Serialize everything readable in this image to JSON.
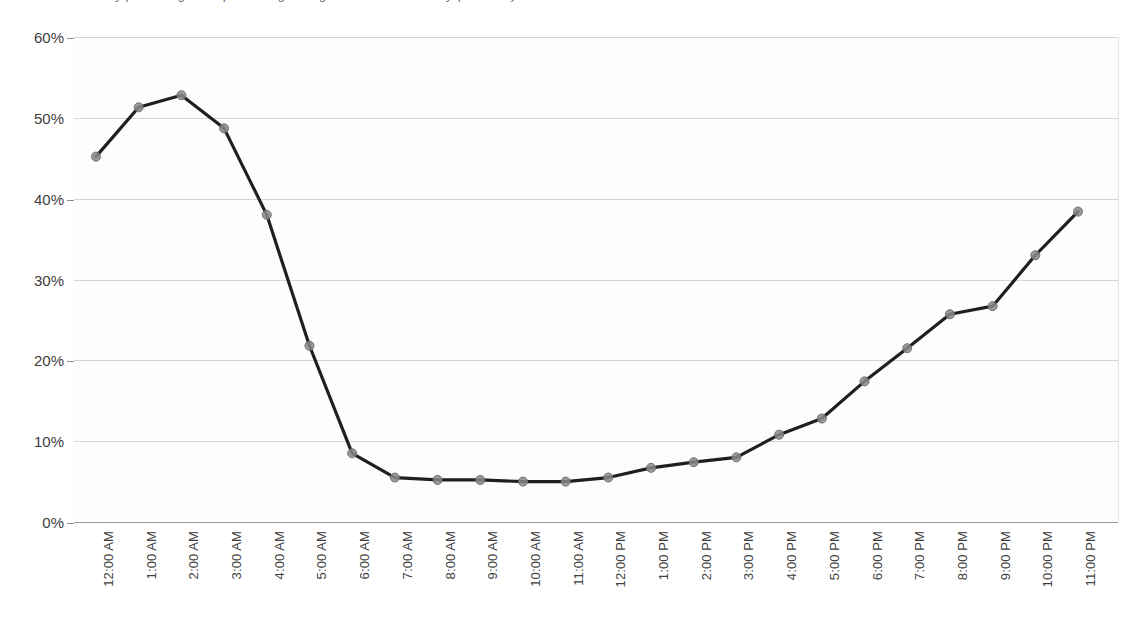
{
  "chart_title": "hourly percentage of trips starting during each hour of the day (all users)",
  "axis": {
    "y_ticks": [
      "0%",
      "10%",
      "20%",
      "30%",
      "40%",
      "50%",
      "60%"
    ],
    "x_label_count": 24
  },
  "style": {
    "line_color": "#1f1f1f",
    "marker_fill": "#8a8a8a",
    "marker_stroke": "#6f6f6f",
    "gridline_color": "#d4d4d4",
    "baseline_color": "#9a9a9a",
    "text_color": "#3d3d3d",
    "plot_background": "#fdfdfd"
  },
  "chart_data": {
    "type": "line",
    "title": "hourly percentage of trips starting during each hour of the day (all users)",
    "xlabel": "",
    "ylabel": "",
    "ylim": [
      0,
      60
    ],
    "y_tick_values": [
      0,
      10,
      20,
      30,
      40,
      50,
      60
    ],
    "y_tick_labels": [
      "0%",
      "10%",
      "20%",
      "30%",
      "40%",
      "50%",
      "60%"
    ],
    "y_unit": "percent",
    "grid": true,
    "legend": false,
    "legend_position": "none",
    "categories": [
      "12:00 AM",
      "1:00 AM",
      "2:00 AM",
      "3:00 AM",
      "4:00 AM",
      "5:00 AM",
      "6:00 AM",
      "7:00 AM",
      "8:00 AM",
      "9:00 AM",
      "10:00 AM",
      "11:00 AM",
      "12:00 PM",
      "1:00 PM",
      "2:00 PM",
      "3:00 PM",
      "4:00 PM",
      "5:00 PM",
      "6:00 PM",
      "7:00 PM",
      "8:00 PM",
      "9:00 PM",
      "10:00 PM",
      "11:00 PM"
    ],
    "values": [
      45.2,
      51.3,
      52.8,
      48.7,
      38.0,
      21.8,
      8.5,
      5.5,
      5.2,
      5.2,
      5.0,
      5.0,
      5.5,
      6.7,
      7.4,
      8.0,
      10.8,
      12.8,
      17.4,
      21.5,
      25.7,
      26.7,
      33.0,
      38.4
    ],
    "markers": "circle",
    "marker_size": 9
  }
}
